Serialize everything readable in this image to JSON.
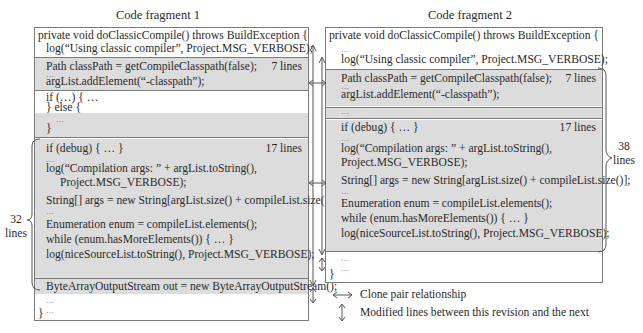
{
  "fragment1": {
    "title": "Code fragment 1",
    "header": [
      "private void doClassicCompile() throws BuildException {",
      "log(“Using classic compiler”, Project.MSG_VERBOSE);"
    ],
    "block_a": {
      "lines": [
        "Path classPath = getCompileClasspath(false);",
        "…",
        "argList.addElement(“-classpath”);"
      ],
      "count": "7 lines"
    },
    "ifelse": [
      "if (…) { …",
      "} else {",
      "…",
      "}"
    ],
    "block_b": {
      "lines": [
        "if (debug) { … }",
        "…",
        "log(“Compilation args: ” + argList.toString(),",
        "Project.MSG_VERBOSE);",
        "String[] args = new String[argList.size() + compileList.size()];",
        "…",
        "Enumeration enum = compileList.elements();",
        "while (enum.hasMoreElements()) { … }",
        "log(niceSourceList.toString(), Project.MSG_VERBOSE);"
      ],
      "count": "17 lines"
    },
    "extra_line": "ByteArrayOutputStream out = new ByteArrayOutputStream();",
    "footer": [
      "…",
      "…",
      "}"
    ],
    "brace": {
      "number": "32",
      "unit": "lines"
    }
  },
  "fragment2": {
    "title": "Code fragment 2",
    "header": [
      "private void doClassicCompile() throws BuildException {",
      "…",
      "log(“Using classic compiler”, Project.MSG_VERBOSE);"
    ],
    "block_a": {
      "lines": [
        "Path classPath = getCompileClasspath(false);",
        "…",
        "argList.addElement(“-classpath”);"
      ],
      "count": "7 lines"
    },
    "gap": "…",
    "block_b": {
      "lines": [
        "if (debug) { … }",
        "…",
        "log(“Compilation args: ” + argList.toString(),",
        "Project.MSG_VERBOSE);",
        "String[] args = new String[argList.size() + compileList.size()];",
        "…",
        "Enumeration enum = compileList.elements();",
        "while (enum.hasMoreElements()) { … }",
        "log(niceSourceList.toString(), Project.MSG_VERBOSE);"
      ],
      "count": "17 lines"
    },
    "footer": [
      "…",
      "…",
      "}"
    ],
    "brace": {
      "number": "38",
      "unit": "lines"
    }
  },
  "legend": {
    "clone_pair": "Clone pair relationship",
    "modified": "Modified lines between this revision and the next"
  },
  "colors": {
    "gray_fill": "#dcdcdc",
    "border": "#7a7a7a",
    "text": "#2a2a2a"
  }
}
